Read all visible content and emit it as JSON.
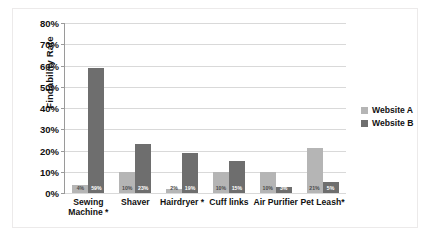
{
  "chart_data": {
    "type": "bar",
    "title": "",
    "xlabel": "",
    "ylabel": "Findability Rate",
    "ylim": [
      0,
      80
    ],
    "grid": true,
    "legend_position": "right",
    "categories": [
      "Sewing Machine *",
      "Shaver",
      "Hairdryer *",
      "Cuff links",
      "Air Purifier",
      "Pet Leash*"
    ],
    "ytick_labels": [
      "80%",
      "70%",
      "60%",
      "50%",
      "40%",
      "30%",
      "20%",
      "10%",
      "0%"
    ],
    "ytick_values": [
      80,
      70,
      60,
      50,
      40,
      30,
      20,
      10,
      0
    ],
    "series": [
      {
        "name": "Website A",
        "color": "#b5b5b5",
        "values": [
          4,
          10,
          2,
          10,
          10,
          21
        ],
        "labels": [
          "4%",
          "10%",
          "2%",
          "10%",
          "10%",
          "21%"
        ]
      },
      {
        "name": "Website B",
        "color": "#6e6e6e",
        "values": [
          59,
          23,
          19,
          15,
          3,
          5
        ],
        "labels": [
          "59%",
          "23%",
          "19%",
          "15%",
          "3%",
          "5%"
        ]
      }
    ]
  }
}
